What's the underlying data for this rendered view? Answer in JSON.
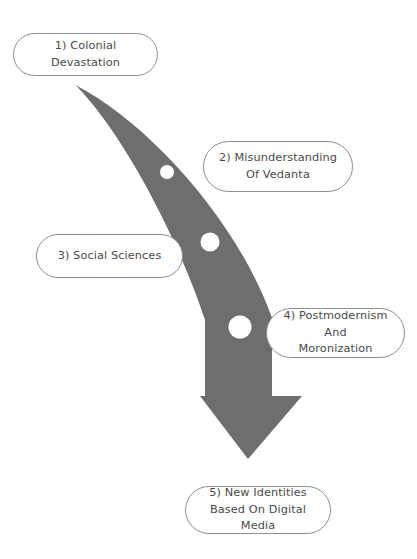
{
  "diagram": {
    "type": "curved-arrow-flow",
    "background_color": "#ffffff",
    "arrow": {
      "name": "curved-down-arrow",
      "fill_color": "#6e6e6e",
      "direction": "down",
      "description": "Tapered curved band sweeping from upper left to lower right, ending in a downward triangular arrowhead",
      "markers": [
        {
          "label": "marker-1",
          "cx": 167,
          "cy": 172,
          "r": 7
        },
        {
          "label": "marker-2",
          "cx": 210,
          "cy": 242,
          "r": 9.5
        },
        {
          "label": "marker-3",
          "cx": 240,
          "cy": 327,
          "r": 11.5
        }
      ]
    },
    "box_border_color": "#8e8e8e",
    "text_color": "#4a4a4a",
    "nodes": [
      {
        "id": "node-1",
        "label": "1) Colonial Devastation"
      },
      {
        "id": "node-2",
        "label": "2) Misunderstanding\nOf Vedanta"
      },
      {
        "id": "node-3",
        "label": "3) Social Sciences"
      },
      {
        "id": "node-4",
        "label": "4) Postmodernism And\nMoronization"
      },
      {
        "id": "node-5",
        "label": "5) New Identities\nBased On Digital Media"
      }
    ]
  }
}
